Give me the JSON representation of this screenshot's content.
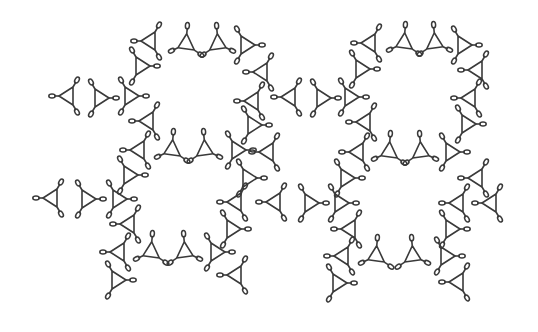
{
  "style": {
    "stroke": "#3a3a3a",
    "background": "#ffffff"
  },
  "units": [
    {
      "x": 68,
      "y": 96,
      "r": 0
    },
    {
      "x": 100,
      "y": 98,
      "r": 180
    },
    {
      "x": 130,
      "y": 96,
      "r": 180
    },
    {
      "x": 150,
      "y": 41,
      "r": 0
    },
    {
      "x": 186,
      "y": 44,
      "r": -25
    },
    {
      "x": 218,
      "y": 44,
      "r": 205
    },
    {
      "x": 246,
      "y": 45,
      "r": 180
    },
    {
      "x": 141,
      "y": 66,
      "r": 180
    },
    {
      "x": 262,
      "y": 72,
      "r": 0
    },
    {
      "x": 148,
      "y": 121,
      "r": 0
    },
    {
      "x": 253,
      "y": 101,
      "r": 0
    },
    {
      "x": 139,
      "y": 150,
      "r": 0
    },
    {
      "x": 172,
      "y": 150,
      "r": -25
    },
    {
      "x": 205,
      "y": 150,
      "r": 205
    },
    {
      "x": 237,
      "y": 150,
      "r": 180
    },
    {
      "x": 253,
      "y": 125,
      "r": 180
    },
    {
      "x": 268,
      "y": 152,
      "r": 0
    },
    {
      "x": 290,
      "y": 97,
      "r": 0
    },
    {
      "x": 322,
      "y": 98,
      "r": 180
    },
    {
      "x": 350,
      "y": 97,
      "r": 180
    },
    {
      "x": 370,
      "y": 43,
      "r": 0
    },
    {
      "x": 404,
      "y": 43,
      "r": -25
    },
    {
      "x": 435,
      "y": 43,
      "r": 205
    },
    {
      "x": 463,
      "y": 45,
      "r": 180
    },
    {
      "x": 361,
      "y": 69,
      "r": 180
    },
    {
      "x": 477,
      "y": 70,
      "r": 0
    },
    {
      "x": 365,
      "y": 122,
      "r": 0
    },
    {
      "x": 470,
      "y": 98,
      "r": 0
    },
    {
      "x": 358,
      "y": 152,
      "r": 0
    },
    {
      "x": 389,
      "y": 152,
      "r": -25
    },
    {
      "x": 421,
      "y": 152,
      "r": 205
    },
    {
      "x": 451,
      "y": 152,
      "r": 180
    },
    {
      "x": 467,
      "y": 124,
      "r": 180
    },
    {
      "x": 477,
      "y": 178,
      "r": 0
    },
    {
      "x": 52,
      "y": 198,
      "r": 0
    },
    {
      "x": 87,
      "y": 199,
      "r": 180
    },
    {
      "x": 118,
      "y": 199,
      "r": 180
    },
    {
      "x": 129,
      "y": 224,
      "r": 0
    },
    {
      "x": 236,
      "y": 202,
      "r": 0
    },
    {
      "x": 119,
      "y": 252,
      "r": 0
    },
    {
      "x": 151,
      "y": 252,
      "r": -25
    },
    {
      "x": 185,
      "y": 252,
      "r": 205
    },
    {
      "x": 216,
      "y": 252,
      "r": 180
    },
    {
      "x": 117,
      "y": 280,
      "r": 180
    },
    {
      "x": 236,
      "y": 275,
      "r": 0
    },
    {
      "x": 129,
      "y": 175,
      "r": 180
    },
    {
      "x": 232,
      "y": 229,
      "r": 180
    },
    {
      "x": 275,
      "y": 202,
      "r": 0
    },
    {
      "x": 310,
      "y": 203,
      "r": 180
    },
    {
      "x": 340,
      "y": 203,
      "r": 180
    },
    {
      "x": 350,
      "y": 229,
      "r": 0
    },
    {
      "x": 458,
      "y": 203,
      "r": 0
    },
    {
      "x": 343,
      "y": 256,
      "r": 0
    },
    {
      "x": 376,
      "y": 256,
      "r": -25
    },
    {
      "x": 413,
      "y": 256,
      "r": 205
    },
    {
      "x": 446,
      "y": 256,
      "r": 180
    },
    {
      "x": 338,
      "y": 283,
      "r": 180
    },
    {
      "x": 458,
      "y": 282,
      "r": 0
    },
    {
      "x": 346,
      "y": 178,
      "r": 180
    },
    {
      "x": 451,
      "y": 229,
      "r": 180
    },
    {
      "x": 491,
      "y": 203,
      "r": 0
    },
    {
      "x": 248,
      "y": 178,
      "r": 180
    }
  ]
}
